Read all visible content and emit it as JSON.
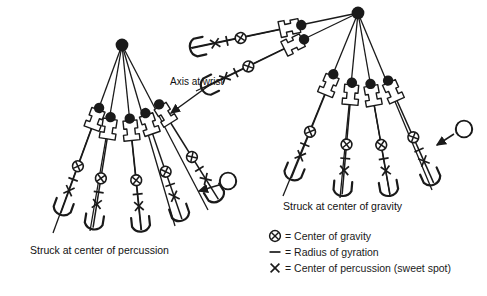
{
  "figure": {
    "type": "physics-diagram",
    "captions": {
      "left": "Struck at center of percussion",
      "right": "Struck at center of gravity"
    },
    "annotations": {
      "axis_at_wrist": "Axis at wrist"
    }
  },
  "legend": {
    "items": [
      {
        "symbol": "circle-x",
        "glyph": "⊗",
        "label": "= Center of gravity"
      },
      {
        "symbol": "dash",
        "glyph": "—",
        "label": "= Radius of gyration"
      },
      {
        "symbol": "x-mark",
        "glyph": "×",
        "label": "= Center of percussion (sweet spot)"
      }
    ]
  },
  "colors": {
    "ink": "#1a1a1a",
    "paper": "#ffffff"
  },
  "panels": {
    "left": {
      "name": "struck-at-center-of-percussion",
      "pivot": {
        "x": 122,
        "y": 45
      },
      "bats": [
        {
          "angle": -52,
          "handle_r": 78,
          "length": 112
        },
        {
          "angle": -68,
          "handle_r": 74,
          "length": 112
        },
        {
          "angle": -84,
          "handle_r": 73,
          "length": 112
        },
        {
          "angle": -96,
          "handle_r": 73,
          "length": 112
        },
        {
          "angle": -112,
          "handle_r": 76,
          "length": 112
        }
      ],
      "ball": {
        "x": 228,
        "y": 181,
        "arrow_to_x": 196,
        "arrow_to_y": 190
      }
    },
    "right": {
      "name": "struck-at-center-of-gravity",
      "pivot": {
        "x": 358,
        "y": 13
      },
      "bats": [
        {
          "angle": -172,
          "handle_r": 60,
          "length": 112
        },
        {
          "angle": -158,
          "handle_r": 62,
          "length": 112
        },
        {
          "angle": -133,
          "handle_r": 68,
          "length": 112
        },
        {
          "angle": -107,
          "handle_r": 70,
          "length": 112
        },
        {
          "angle": -97,
          "handle_r": 73,
          "length": 112
        },
        {
          "angle": -78,
          "handle_r": 75,
          "length": 112
        }
      ],
      "ball": {
        "x": 464,
        "y": 129,
        "arrow_to_x": 438,
        "arrow_to_y": 145
      }
    }
  }
}
